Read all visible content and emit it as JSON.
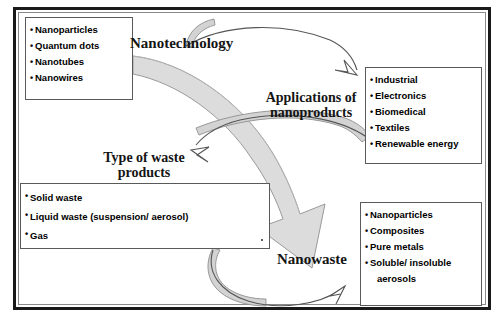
{
  "diagram": {
    "colors": {
      "frame_border": "#1a1a1a",
      "box_border": "#5a5a5a",
      "text": "#000000",
      "thick_arrow_fill": "#d9d9d9",
      "thick_arrow_stroke": "#8c8c8c",
      "thin_arrow_stroke": "#4a4a4a"
    },
    "boxes": [
      {
        "name": "nanomaterials",
        "items": [
          "Nanoparticles",
          "Quantum dots",
          "Nanotubes",
          "Nanowires"
        ]
      },
      {
        "name": "applications",
        "items": [
          "Industrial",
          "Electronics",
          "Biomedical",
          "Textiles",
          "Renewable energy"
        ]
      },
      {
        "name": "waste-types",
        "items": [
          "Solid waste",
          "Liquid waste (suspension/ aerosol)",
          "Gas"
        ]
      },
      {
        "name": "nanowaste-products",
        "items": [
          "Nanoparticles",
          "Composites",
          "Pure metals",
          "Soluble/ insoluble",
          "aerosols"
        ]
      }
    ],
    "labels": {
      "nanotechnology": "Nanotechnology",
      "applications_line1": "Applications of",
      "applications_line2": "nanoproducts",
      "waste_line1": "Type of waste",
      "waste_line2": "products",
      "nanowaste": "Nanowaste"
    },
    "arrows": [
      {
        "name": "nanotechnology-to-applications",
        "style": "thin-hollow-head",
        "from": "nanotechnology",
        "to": "applications"
      },
      {
        "name": "applications-to-waste-types",
        "style": "thin-hollow-head",
        "from": "applications",
        "to": "waste-types"
      },
      {
        "name": "waste-types-to-nanowaste",
        "style": "thin-hollow-head",
        "from": "waste-types",
        "to": "nanowaste-products"
      },
      {
        "name": "nanomaterials-to-nanowaste",
        "style": "thick-gray-sweep",
        "from": "nanomaterials",
        "to": "nanowaste"
      }
    ]
  }
}
